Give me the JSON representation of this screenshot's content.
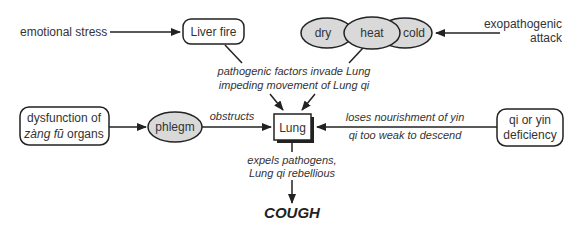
{
  "diagram": {
    "type": "flow-diagram",
    "center_node": {
      "label": "Lung"
    },
    "outcome": {
      "label": "COUGH"
    },
    "nodes": {
      "emotional_stress": "emotional stress",
      "liver_fire": "Liver fire",
      "dry": "dry",
      "heat": "heat",
      "cold": "cold",
      "exopathogenic_line1": "exopathogenic",
      "exopathogenic_line2": "attack",
      "dysfunction_line1": "dysfunction of",
      "dysfunction_line2_italic": "zàng fŭ",
      "dysfunction_line2_rest": " organs",
      "phlegm": "phlegm",
      "deficiency_line1": "qi or yin",
      "deficiency_line2": "deficiency"
    },
    "edge_labels": {
      "invade_line1": "pathogenic factors invade Lung",
      "invade_line2": "impeding movement of Lung qi",
      "obstructs": "obstructs",
      "loses_nourishment": "loses nourishment of yin",
      "qi_too_weak": "qi too weak to descend",
      "expels_line1": "expels pathogens,",
      "expels_line2": "Lung qi rebellious"
    },
    "colors": {
      "ellipse_fill": "#d9d9d9",
      "stroke": "#222222",
      "text": "#333333"
    }
  }
}
